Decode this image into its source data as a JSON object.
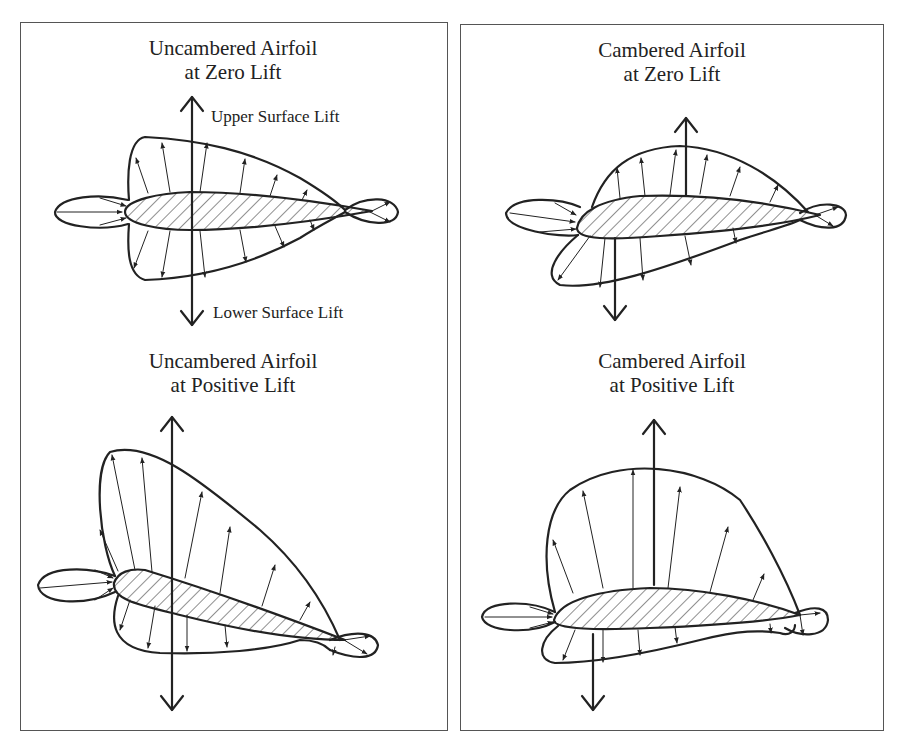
{
  "panels": [
    {
      "name": "uncambered",
      "diagrams": [
        {
          "title_line1": "Uncambered Airfoil",
          "title_line2": "at Zero Lift",
          "labels": {
            "upper": "Upper Surface Lift",
            "lower": "Lower Surface Lift"
          }
        },
        {
          "title_line1": "Uncambered Airfoil",
          "title_line2": "at Positive Lift"
        }
      ]
    },
    {
      "name": "cambered",
      "diagrams": [
        {
          "title_line1": "Cambered Airfoil",
          "title_line2": "at Zero Lift"
        },
        {
          "title_line1": "Cambered Airfoil",
          "title_line2": "at Positive Lift"
        }
      ]
    }
  ],
  "colors": {
    "line": "#222222",
    "border": "#555555",
    "background": "#ffffff"
  }
}
